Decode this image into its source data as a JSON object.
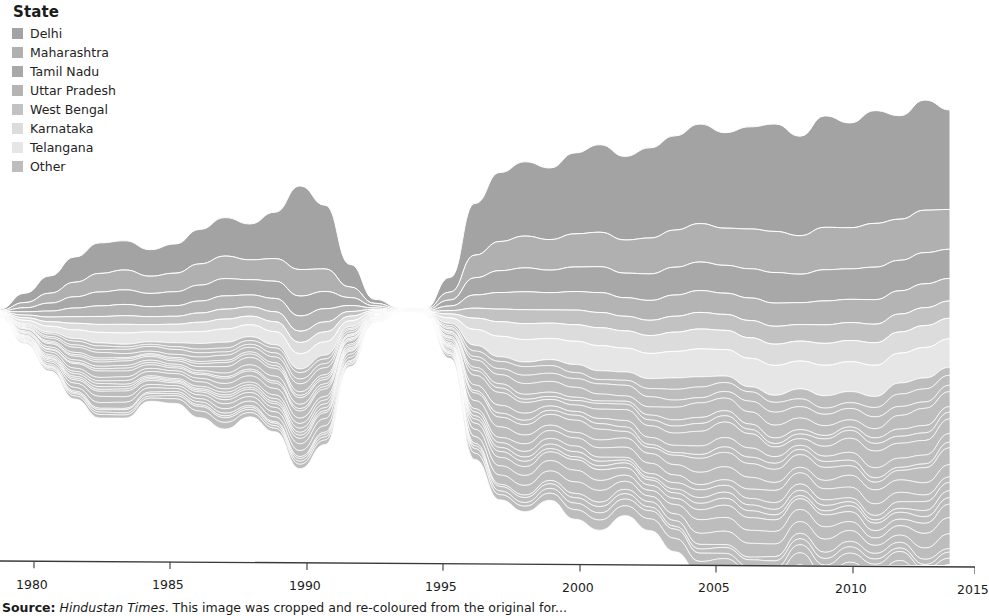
{
  "legend": {
    "title": "State",
    "items": [
      {
        "label": "Delhi",
        "color": "#a3a3a3"
      },
      {
        "label": "Maharashtra",
        "color": "#b0b0b0"
      },
      {
        "label": "Tamil Nadu",
        "color": "#a8a8a8"
      },
      {
        "label": "Uttar Pradesh",
        "color": "#b4b4b4"
      },
      {
        "label": "West Bengal",
        "color": "#c2c2c2"
      },
      {
        "label": "Karnataka",
        "color": "#dcdcdc"
      },
      {
        "label": "Telangana",
        "color": "#e6e6e6"
      },
      {
        "label": "Other",
        "color": "#bdbdbd"
      }
    ]
  },
  "axis": {
    "tick_labels": [
      "1980",
      "1985",
      "1990",
      "1995",
      "2000",
      "2005",
      "2010",
      "2015"
    ],
    "tick_x": [
      34,
      170,
      307,
      443,
      580,
      716,
      853,
      975
    ],
    "line_color": "#3a3a3a"
  },
  "source": {
    "prefix": "Source:",
    "publication": "Hindustan Times",
    "note": ". This image was cropped and re-coloured from the original for..."
  },
  "chart_data": {
    "type": "area",
    "subtype": "streamgraph",
    "title": "",
    "xlabel": "",
    "ylabel": "",
    "xlim": [
      1979.0,
      2018.0
    ],
    "xticks": [
      1980,
      1985,
      1990,
      1995,
      2000,
      2005,
      2010,
      2015
    ],
    "grid": false,
    "legend_position": "top-left",
    "offset": "wiggle",
    "note_gap": "Series data is missing / near-zero between 1995 and 1996 producing a pinch in the stream.",
    "x": [
      1979,
      1980,
      1981,
      1982,
      1983,
      1984,
      1985,
      1986,
      1987,
      1988,
      1989,
      1990,
      1991,
      1992,
      1993,
      1994,
      1995,
      1996,
      1997,
      1998,
      1999,
      2000,
      2001,
      2002,
      2003,
      2004,
      2005,
      2006,
      2007,
      2008,
      2009,
      2010,
      2011,
      2012,
      2013,
      2014,
      2015,
      2016,
      2017
    ],
    "series": [
      {
        "name": "Delhi",
        "color": "#a3a3a3",
        "values": [
          2,
          14,
          26,
          38,
          46,
          44,
          40,
          44,
          52,
          58,
          54,
          70,
          126,
          96,
          34,
          6,
          1,
          1,
          22,
          78,
          104,
          112,
          108,
          122,
          132,
          126,
          136,
          142,
          150,
          144,
          154,
          162,
          150,
          168,
          158,
          170,
          156,
          166,
          150
        ]
      },
      {
        "name": "Maharashtra",
        "color": "#b0b0b0",
        "values": [
          1,
          8,
          15,
          22,
          28,
          30,
          26,
          28,
          32,
          34,
          30,
          34,
          40,
          34,
          16,
          4,
          1,
          1,
          12,
          34,
          44,
          48,
          46,
          50,
          52,
          50,
          54,
          56,
          58,
          56,
          60,
          62,
          58,
          64,
          62,
          66,
          62,
          64,
          60
        ]
      },
      {
        "name": "Tamil Nadu",
        "color": "#a8a8a8",
        "values": [
          1,
          6,
          12,
          17,
          21,
          22,
          20,
          21,
          24,
          26,
          23,
          26,
          30,
          26,
          12,
          3,
          1,
          1,
          9,
          26,
          33,
          36,
          34,
          37,
          39,
          37,
          40,
          42,
          43,
          42,
          44,
          46,
          43,
          47,
          46,
          49,
          46,
          47,
          44
        ]
      },
      {
        "name": "Uttar Pradesh",
        "color": "#b4b4b4",
        "values": [
          1,
          5,
          9,
          13,
          16,
          17,
          15,
          16,
          18,
          20,
          18,
          20,
          23,
          20,
          9,
          2,
          1,
          1,
          7,
          20,
          25,
          27,
          26,
          28,
          30,
          28,
          30,
          32,
          33,
          32,
          34,
          35,
          33,
          36,
          35,
          37,
          35,
          36,
          34
        ]
      },
      {
        "name": "West Bengal",
        "color": "#c2c2c2",
        "values": [
          1,
          4,
          7,
          10,
          12,
          13,
          12,
          12,
          14,
          15,
          14,
          15,
          17,
          15,
          7,
          2,
          1,
          1,
          5,
          15,
          19,
          21,
          20,
          22,
          23,
          22,
          23,
          24,
          25,
          24,
          26,
          27,
          25,
          28,
          27,
          28,
          27,
          27,
          26
        ]
      },
      {
        "name": "Karnataka",
        "color": "#dcdcdc",
        "values": [
          1,
          4,
          7,
          10,
          12,
          13,
          11,
          12,
          14,
          15,
          13,
          15,
          17,
          15,
          7,
          2,
          1,
          1,
          6,
          17,
          22,
          24,
          23,
          25,
          27,
          26,
          27,
          29,
          30,
          29,
          31,
          32,
          30,
          33,
          32,
          34,
          32,
          33,
          31
        ]
      },
      {
        "name": "Telangana",
        "color": "#e6e6e6",
        "values": [
          1,
          5,
          9,
          13,
          16,
          17,
          15,
          16,
          18,
          20,
          18,
          20,
          23,
          20,
          9,
          2,
          1,
          1,
          8,
          24,
          31,
          34,
          32,
          35,
          38,
          36,
          38,
          40,
          42,
          40,
          43,
          45,
          42,
          46,
          45,
          47,
          45,
          46,
          43
        ]
      },
      {
        "name": "Other",
        "color": "#bdbdbd",
        "values": [
          4,
          30,
          58,
          86,
          104,
          108,
          96,
          102,
          118,
          128,
          116,
          128,
          146,
          128,
          58,
          14,
          2,
          2,
          52,
          160,
          204,
          222,
          210,
          230,
          246,
          236,
          250,
          262,
          272,
          262,
          280,
          290,
          272,
          298,
          290,
          306,
          292,
          298,
          280
        ]
      }
    ],
    "other_substrata": 22
  }
}
